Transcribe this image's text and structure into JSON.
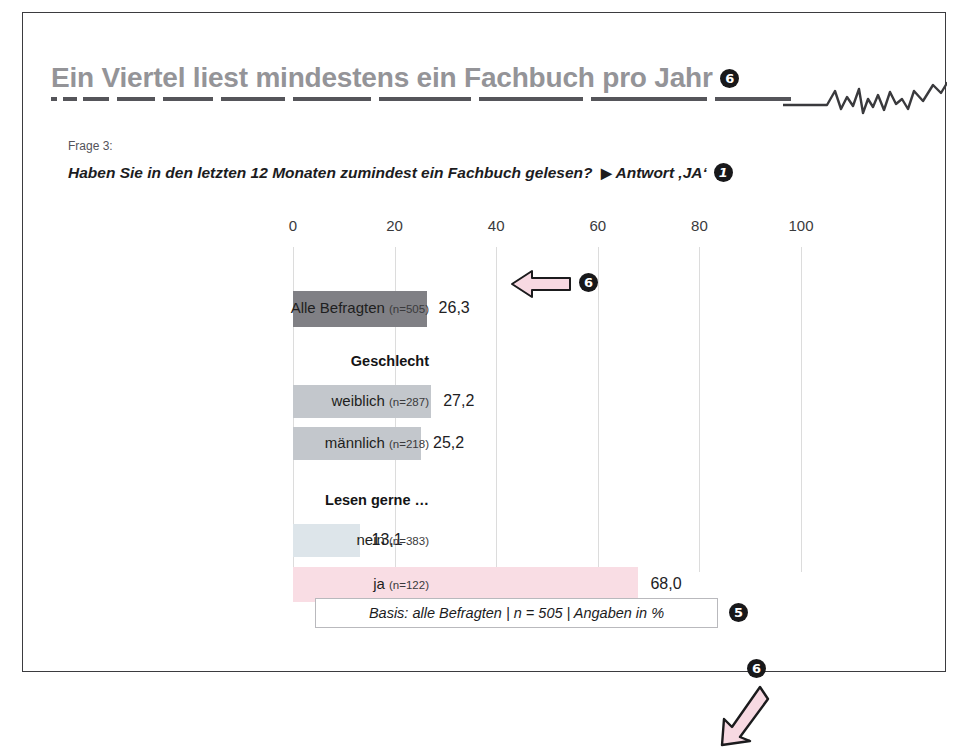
{
  "slide": {
    "title": "Ein Viertel liest mindestens ein Fachbuch pro Jahr",
    "title_marker": "6",
    "question_number": "Frage 3:",
    "question": "Haben Sie in den letzten 12 Monaten zumindest ein Fachbuch gelesen?",
    "question_arrow": "▶",
    "answer_note": "Antwort ‚JA‘",
    "answer_marker": "1",
    "basis_note": "Basis: alle Befragten | n = 505 | Angaben in %",
    "basis_marker": "5",
    "callout_bar_marker": "6",
    "callout_ja_marker": "6"
  },
  "chart_data": {
    "type": "bar",
    "orientation": "horizontal",
    "title": "Ein Viertel liest mindestens ein Fachbuch pro Jahr",
    "subtitle": "Haben Sie in den letzten 12 Monaten zumindest ein Fachbuch gelesen? ▶ Antwort ‚JA‘",
    "xlabel": "",
    "ylabel": "",
    "xlim": [
      0,
      100
    ],
    "xticks": [
      "0",
      "20",
      "40",
      "60",
      "80",
      "100"
    ],
    "xtick_values": [
      0,
      20,
      40,
      60,
      80,
      100
    ],
    "grid": "vertical",
    "legend": "none",
    "annotation": "Basis: alle Befragten | n = 505 | Angaben in %",
    "rows": [
      {
        "kind": "bar",
        "label": "Alle Befragten",
        "n": "(n=505)",
        "value": 26.3,
        "value_label": "26,3",
        "color": "#808085",
        "top": 44,
        "height": 36
      },
      {
        "kind": "group",
        "label": "Geschlecht",
        "top": 106
      },
      {
        "kind": "bar",
        "label": "weiblich",
        "n": "(n=287)",
        "value": 27.2,
        "value_label": "27,2",
        "color": "#c3c7cc",
        "top": 138,
        "height": 33
      },
      {
        "kind": "bar",
        "label": "männlich",
        "n": "(n=218)",
        "value": 25.2,
        "value_label": "25,2",
        "color": "#c3c7cc",
        "top": 180,
        "height": 33
      },
      {
        "kind": "group",
        "label": "Lesen gerne …",
        "top": 245
      },
      {
        "kind": "bar",
        "label": "nein",
        "n": "(n=383)",
        "value": 13.1,
        "value_label": "13,1",
        "color": "#dde5ea",
        "top": 277,
        "height": 33
      },
      {
        "kind": "bar",
        "label": "ja",
        "n": "(n=122)",
        "value": 68.0,
        "value_label": "68,0",
        "color": "#f9dde4",
        "top": 320,
        "height": 35
      }
    ],
    "colors": {
      "bar_all": "#808085",
      "bar_gender": "#c3c7cc",
      "bar_nein": "#dde5ea",
      "bar_ja": "#f9dde4",
      "grid": "#dcdcdc",
      "title": "#949498",
      "arrow_fill": "#f7d9e2"
    }
  }
}
